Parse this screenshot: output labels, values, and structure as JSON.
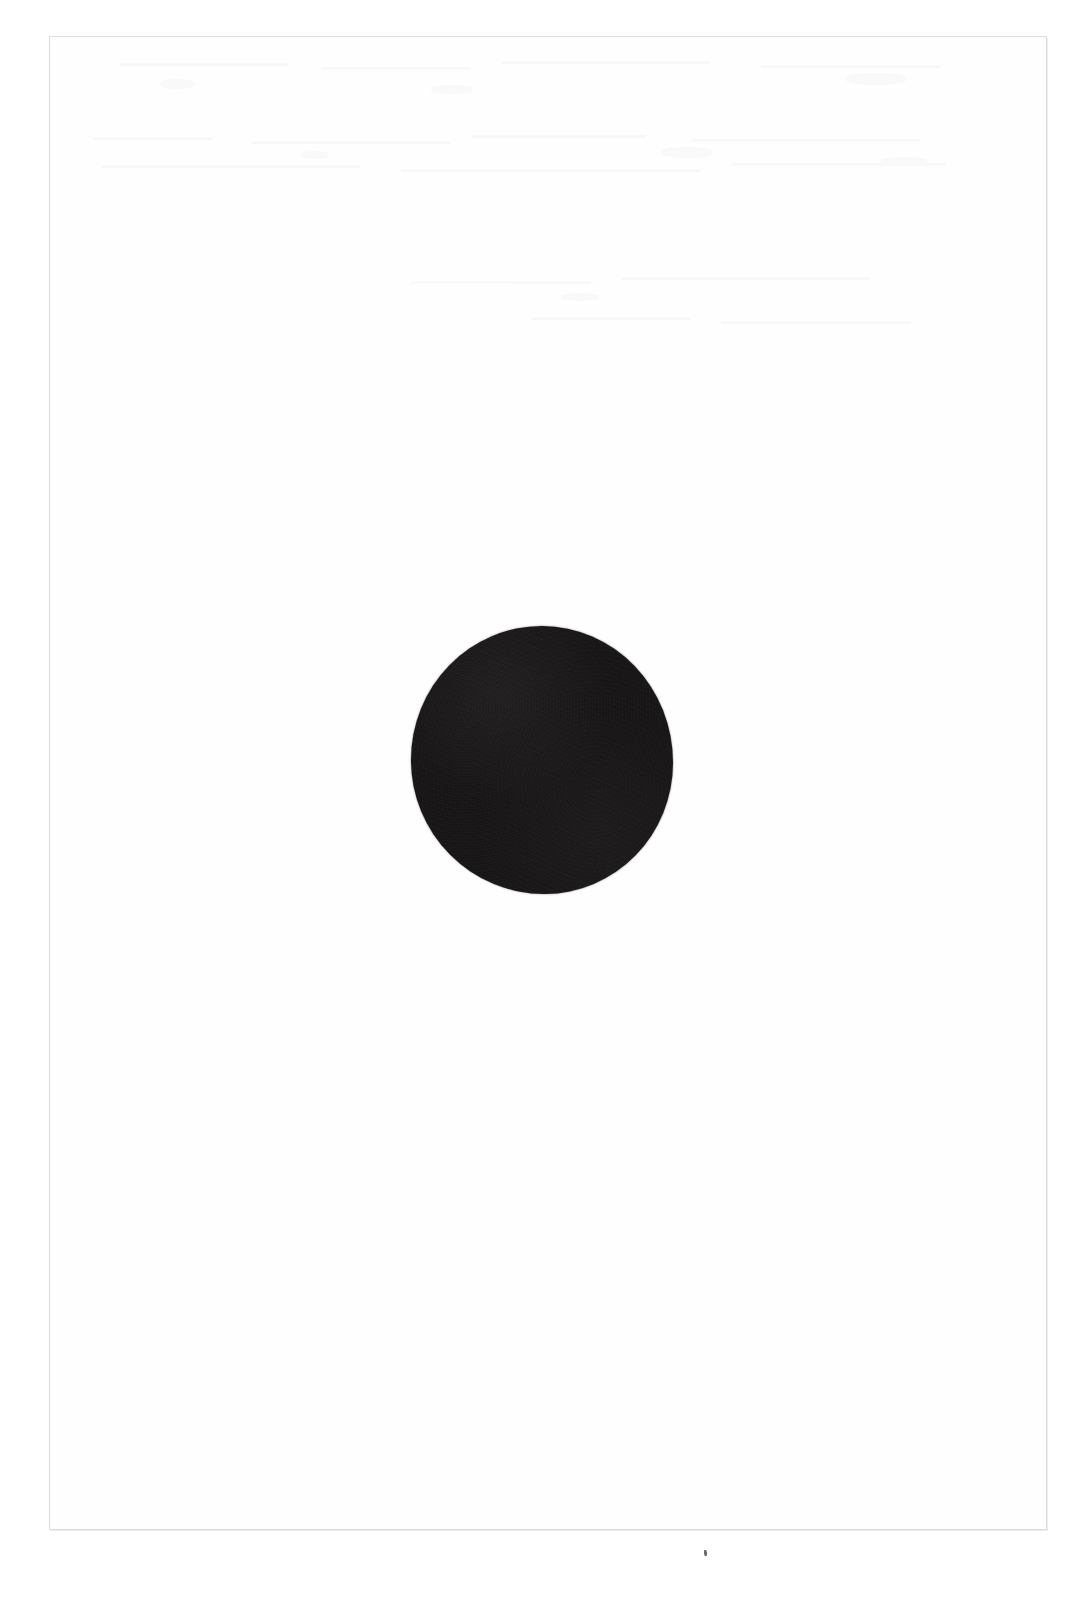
{
  "document": {
    "kind": "scanned-page",
    "page_background_color": "#ffffff",
    "canvas_width": 1086,
    "canvas_height": 1605,
    "title_text": "",
    "body_text": "",
    "caption_text": "",
    "page_number_text": "",
    "visible_text_present": false
  },
  "page_frame": {
    "name": "scanned-sheet-border",
    "border_color": "#dcdcdc",
    "fill_color": "#fefefe",
    "left": 49,
    "top": 36,
    "width": 998,
    "height": 1494
  },
  "figure": {
    "name": "solid-black-disc",
    "shape": "circle",
    "fill_color": "#171515",
    "center_x": 541,
    "center_y": 756,
    "diameter": 262,
    "label_text": ""
  },
  "artifacts": {
    "ink_speck": {
      "name": "ink-speck",
      "color": "#6a6a6a",
      "x": 704,
      "y": 1550,
      "width": 3,
      "height": 6
    },
    "ghost_marks": {
      "name": "bleed-through-ghost-marks",
      "color": "#f4f4f4",
      "description_visible": false,
      "lines": [
        {
          "x": 118,
          "y": 62,
          "w": 170
        },
        {
          "x": 320,
          "y": 66,
          "w": 150
        },
        {
          "x": 500,
          "y": 60,
          "w": 210
        },
        {
          "x": 760,
          "y": 64,
          "w": 180
        },
        {
          "x": 92,
          "y": 136,
          "w": 120
        },
        {
          "x": 250,
          "y": 140,
          "w": 200
        },
        {
          "x": 470,
          "y": 134,
          "w": 175
        },
        {
          "x": 690,
          "y": 138,
          "w": 230
        },
        {
          "x": 100,
          "y": 164,
          "w": 260
        },
        {
          "x": 400,
          "y": 168,
          "w": 300
        },
        {
          "x": 730,
          "y": 162,
          "w": 215
        },
        {
          "x": 410,
          "y": 280,
          "w": 180
        },
        {
          "x": 620,
          "y": 276,
          "w": 250
        },
        {
          "x": 530,
          "y": 316,
          "w": 160
        },
        {
          "x": 720,
          "y": 320,
          "w": 190
        }
      ],
      "blobs": [
        {
          "x": 160,
          "y": 78,
          "w": 34,
          "h": 10
        },
        {
          "x": 430,
          "y": 84,
          "w": 42,
          "h": 9
        },
        {
          "x": 845,
          "y": 72,
          "w": 60,
          "h": 12
        },
        {
          "x": 300,
          "y": 150,
          "w": 28,
          "h": 8
        },
        {
          "x": 660,
          "y": 146,
          "w": 52,
          "h": 11
        },
        {
          "x": 880,
          "y": 156,
          "w": 46,
          "h": 9
        },
        {
          "x": 560,
          "y": 292,
          "w": 38,
          "h": 8
        }
      ]
    }
  }
}
